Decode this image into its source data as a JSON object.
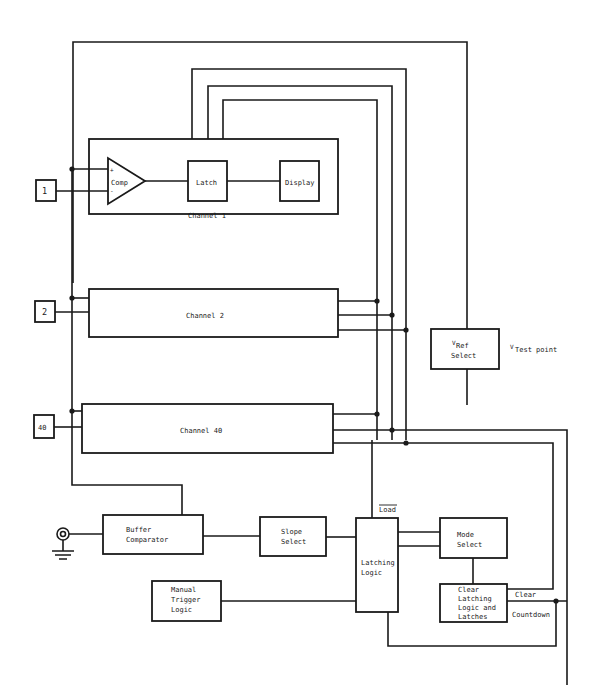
{
  "diagram": {
    "inputs": [
      {
        "label": "1"
      },
      {
        "label": "2"
      },
      {
        "label": "40"
      }
    ],
    "channel1": {
      "label": "Channel 1",
      "comp": {
        "label": "Comp",
        "plus": "+",
        "minus": "-"
      },
      "latch": {
        "label": "Latch"
      },
      "display": {
        "label": "Display"
      }
    },
    "channel2": {
      "label": "Channel 2"
    },
    "channel40": {
      "label": "Channel 40"
    },
    "vref": {
      "v": "V",
      "sub": "Ref",
      "line2": "Select"
    },
    "vtest": {
      "v": "V",
      "sub": "Test point"
    },
    "buffer": {
      "line1": "Buffer",
      "line2": "Comparator"
    },
    "slope": {
      "line1": "Slope",
      "line2": "Select"
    },
    "latching_logic": {
      "line1": "Latching",
      "line2": "Logic",
      "load": "Load"
    },
    "mode": {
      "line1": "Mode",
      "line2": "Select"
    },
    "manual": {
      "line1": "Manual",
      "line2": "Trigger",
      "line3": "Logic"
    },
    "clear_box": {
      "line1": "Clear",
      "line2": "Latching",
      "line3": "Logic and",
      "line4": "Latches"
    },
    "signals": {
      "clear": "Clear",
      "countdown": "Countdown"
    }
  }
}
